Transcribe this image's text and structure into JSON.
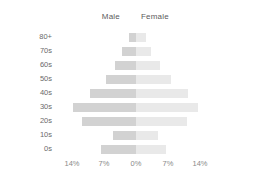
{
  "legend": {
    "male_label": "Male",
    "female_label": "Female"
  },
  "axis": {
    "x_ticks": [
      "14%",
      "7%",
      "0%",
      "7%",
      "14%"
    ],
    "y_labels": [
      "80+",
      "70s",
      "60s",
      "50s",
      "40s",
      "30s",
      "20s",
      "10s",
      "0s"
    ]
  },
  "colors": {
    "male_bar": "#d2d2d2",
    "female_bar": "#e9e9e9",
    "tick_text": "#8a8a8a",
    "label_text": "#6a6a6a",
    "legend_text": "#5c5c5c",
    "background": "#ffffff"
  },
  "chart_data": {
    "type": "bar",
    "subtype": "population-pyramid",
    "title": "",
    "xlabel": "",
    "ylabel": "",
    "categories": [
      "80+",
      "70s",
      "60s",
      "50s",
      "40s",
      "30s",
      "20s",
      "10s",
      "0s"
    ],
    "series": [
      {
        "name": "Male",
        "direction": "left",
        "values": [
          1.6,
          3.0,
          4.6,
          6.6,
          10.0,
          13.7,
          11.8,
          5.0,
          7.7
        ]
      },
      {
        "name": "Female",
        "direction": "right",
        "values": [
          2.2,
          3.3,
          5.2,
          7.6,
          11.4,
          13.5,
          11.2,
          4.8,
          6.6
        ]
      }
    ],
    "xlim": [
      -14,
      14
    ],
    "x_tick_values": [
      -14,
      -7,
      0,
      7,
      14
    ],
    "x_tick_labels": [
      "14%",
      "7%",
      "0%",
      "7%",
      "14%"
    ],
    "grid": false,
    "legend_position": "top-center",
    "units": "percent"
  }
}
